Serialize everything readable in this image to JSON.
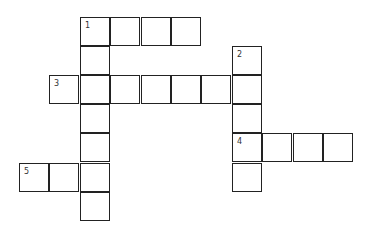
{
  "puzzle": {
    "origin": {
      "x": 19,
      "y": 17
    },
    "cell_w": 30.4,
    "cell_h": 29.1,
    "cells": [
      {
        "r": 0,
        "c": 2,
        "num": "1"
      },
      {
        "r": 0,
        "c": 3
      },
      {
        "r": 0,
        "c": 4
      },
      {
        "r": 0,
        "c": 5
      },
      {
        "r": 1,
        "c": 2
      },
      {
        "r": 1,
        "c": 7,
        "num": "2"
      },
      {
        "r": 2,
        "c": 1,
        "num": "3"
      },
      {
        "r": 2,
        "c": 2
      },
      {
        "r": 2,
        "c": 3
      },
      {
        "r": 2,
        "c": 4
      },
      {
        "r": 2,
        "c": 5
      },
      {
        "r": 2,
        "c": 6
      },
      {
        "r": 2,
        "c": 7
      },
      {
        "r": 3,
        "c": 2
      },
      {
        "r": 3,
        "c": 7
      },
      {
        "r": 4,
        "c": 2
      },
      {
        "r": 4,
        "c": 7,
        "num": "4"
      },
      {
        "r": 4,
        "c": 8
      },
      {
        "r": 4,
        "c": 9
      },
      {
        "r": 4,
        "c": 10
      },
      {
        "r": 5,
        "c": 0,
        "num": "5"
      },
      {
        "r": 5,
        "c": 1
      },
      {
        "r": 5,
        "c": 2
      },
      {
        "r": 5,
        "c": 7
      },
      {
        "r": 6,
        "c": 2
      }
    ],
    "entries": [
      {
        "number": "1",
        "direction": "across",
        "length": 4
      },
      {
        "number": "1",
        "direction": "down",
        "length": 7
      },
      {
        "number": "2",
        "direction": "down",
        "length": 5
      },
      {
        "number": "3",
        "direction": "across",
        "length": 7
      },
      {
        "number": "4",
        "direction": "across",
        "length": 4
      },
      {
        "number": "5",
        "direction": "across",
        "length": 3
      }
    ]
  }
}
